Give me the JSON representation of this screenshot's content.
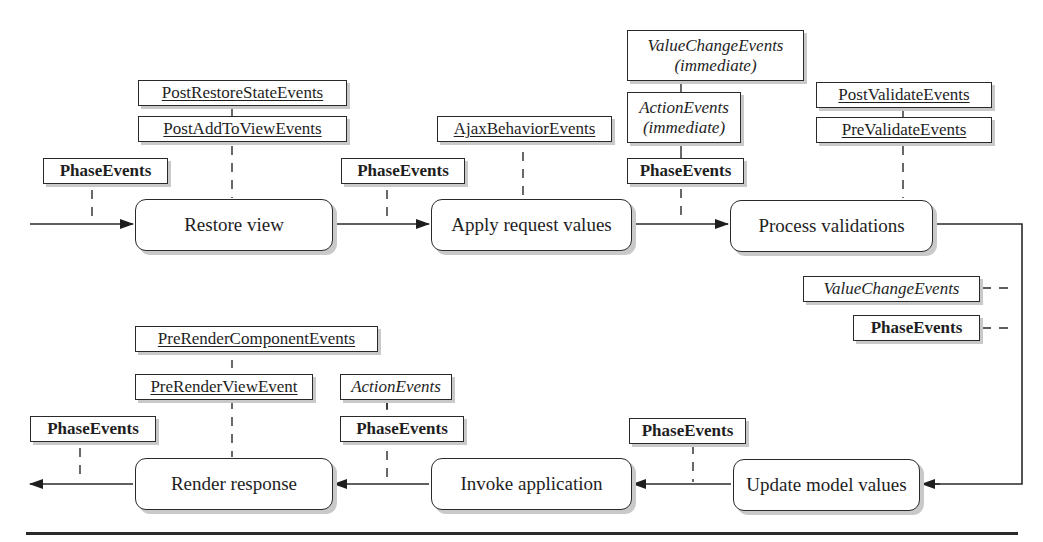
{
  "diagram": {
    "title": "",
    "phases": {
      "restore_view": "Restore view",
      "apply_request_values": "Apply request values",
      "process_validations": "Process validations",
      "update_model_values": "Update model values",
      "invoke_application": "Invoke application",
      "render_response": "Render response"
    },
    "events": {
      "phase_events": "PhaseEvents",
      "post_restore_state": "PostRestoreStateEvents",
      "post_add_to_view": "PostAddToViewEvents",
      "ajax_behavior": "AjaxBehaviorEvents",
      "value_change_immediate_line1": "ValueChangeEvents",
      "value_change_immediate_line2": "(immediate)",
      "action_immediate_line1": "ActionEvents",
      "action_immediate_line2": "(immediate)",
      "post_validate": "PostValidateEvents",
      "pre_validate": "PreValidateEvents",
      "value_change": "ValueChangeEvents",
      "pre_render_component": "PreRenderComponentEvents",
      "pre_render_view": "PreRenderViewEvent",
      "action": "ActionEvents"
    },
    "flow": [
      "Restore view",
      "Apply request values",
      "Process validations",
      "Update model values",
      "Invoke application",
      "Render response"
    ],
    "colors": {
      "line": "#2a2a2a",
      "shadow": "#c9c9c9",
      "background": "#ffffff"
    }
  }
}
